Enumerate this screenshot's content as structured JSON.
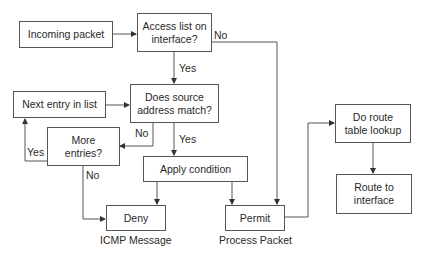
{
  "nodes": {
    "incoming": "Incoming packet",
    "access_list": "Access list on interface?",
    "source_match": "Does source address match?",
    "next_entry": "Next entry in list",
    "more_entries": "More entries?",
    "apply_condition": "Apply condition",
    "deny": "Deny",
    "permit": "Permit",
    "route_lookup": "Do route table lookup",
    "route_interface": "Route to interface"
  },
  "captions": {
    "deny": "ICMP Message",
    "permit": "Process Packet"
  },
  "edge_labels": {
    "access_no": "No",
    "access_yes": "Yes",
    "match_no": "No",
    "match_yes": "Yes",
    "more_yes": "Yes",
    "more_no": "No"
  }
}
